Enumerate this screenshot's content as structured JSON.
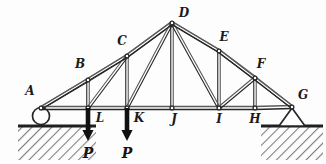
{
  "figure": {
    "style": {
      "ink": "#262626",
      "ink_light": "#5a5a5a",
      "ground_fill": "#8f8f8f",
      "background": "#fdfdfd",
      "member_width": 1.1,
      "chord_width": 1.6
    }
  },
  "geometry": {
    "view_box": "0 0 326 164",
    "nodes": [
      {
        "id": "A",
        "x": 41,
        "y": 108,
        "label": "A",
        "label_x": 30,
        "label_y": 95,
        "label_anchor": "middle"
      },
      {
        "id": "B",
        "x": 88,
        "y": 80,
        "label": "B",
        "label_x": 80,
        "label_y": 68,
        "label_anchor": "middle"
      },
      {
        "id": "C",
        "x": 127,
        "y": 56,
        "label": "C",
        "label_x": 122,
        "label_y": 45,
        "label_anchor": "middle"
      },
      {
        "id": "D",
        "x": 172,
        "y": 23,
        "label": "D",
        "label_x": 184,
        "label_y": 17,
        "label_anchor": "middle"
      },
      {
        "id": "E",
        "x": 219,
        "y": 51,
        "label": "E",
        "label_x": 224,
        "label_y": 41,
        "label_anchor": "middle"
      },
      {
        "id": "F",
        "x": 255,
        "y": 78,
        "label": "F",
        "label_x": 261,
        "label_y": 68,
        "label_anchor": "middle"
      },
      {
        "id": "G",
        "x": 292,
        "y": 107,
        "label": "G",
        "label_x": 303,
        "label_y": 99,
        "label_anchor": "middle"
      },
      {
        "id": "H",
        "x": 255,
        "y": 108,
        "label": "H",
        "label_x": 255,
        "label_y": 123,
        "label_anchor": "middle"
      },
      {
        "id": "I",
        "x": 219,
        "y": 108,
        "label": "I",
        "label_x": 219,
        "label_y": 123,
        "label_anchor": "middle"
      },
      {
        "id": "J",
        "x": 172,
        "y": 108,
        "label": "J",
        "label_x": 174,
        "label_y": 123,
        "label_anchor": "middle"
      },
      {
        "id": "K",
        "x": 127,
        "y": 108,
        "label": "K",
        "label_x": 139,
        "label_y": 122,
        "label_anchor": "middle"
      },
      {
        "id": "L",
        "x": 88,
        "y": 108,
        "label": "L",
        "label_x": 100,
        "label_y": 122,
        "label_anchor": "middle"
      }
    ],
    "members": [
      {
        "from": "A",
        "to": "B",
        "kind": "top-chord"
      },
      {
        "from": "B",
        "to": "C",
        "kind": "top-chord"
      },
      {
        "from": "C",
        "to": "D",
        "kind": "top-chord"
      },
      {
        "from": "D",
        "to": "E",
        "kind": "top-chord"
      },
      {
        "from": "E",
        "to": "F",
        "kind": "top-chord"
      },
      {
        "from": "F",
        "to": "G",
        "kind": "top-chord"
      },
      {
        "from": "A",
        "to": "L",
        "kind": "bottom-chord"
      },
      {
        "from": "L",
        "to": "K",
        "kind": "bottom-chord"
      },
      {
        "from": "K",
        "to": "J",
        "kind": "bottom-chord"
      },
      {
        "from": "J",
        "to": "I",
        "kind": "bottom-chord"
      },
      {
        "from": "I",
        "to": "H",
        "kind": "bottom-chord"
      },
      {
        "from": "H",
        "to": "G",
        "kind": "bottom-chord"
      },
      {
        "from": "B",
        "to": "L",
        "kind": "vertical"
      },
      {
        "from": "C",
        "to": "K",
        "kind": "vertical"
      },
      {
        "from": "D",
        "to": "J",
        "kind": "vertical"
      },
      {
        "from": "E",
        "to": "I",
        "kind": "vertical"
      },
      {
        "from": "F",
        "to": "H",
        "kind": "vertical"
      },
      {
        "from": "L",
        "to": "C",
        "kind": "diagonal"
      },
      {
        "from": "K",
        "to": "D",
        "kind": "diagonal"
      },
      {
        "from": "D",
        "to": "I",
        "kind": "diagonal"
      },
      {
        "from": "I",
        "to": "F",
        "kind": "diagonal"
      },
      {
        "from": "A",
        "to": "C",
        "kind": "diagonal"
      },
      {
        "from": "C",
        "to": "D",
        "kind": "diagonal"
      },
      {
        "from": "D",
        "to": "E",
        "kind": "diagonal"
      },
      {
        "from": "E",
        "to": "G",
        "kind": "diagonal"
      }
    ]
  },
  "supports": {
    "roller": {
      "node": "A",
      "type": "roller-circle",
      "cx": 41,
      "cy": 116,
      "r": 8.5
    },
    "pin": {
      "node": "G",
      "type": "pin-triangle",
      "apex_x": 292,
      "apex_y": 108,
      "base_left_x": 279,
      "base_right_x": 305,
      "base_y": 126
    }
  },
  "ground": [
    {
      "id": "left",
      "x": 18,
      "y": 126,
      "width": 78,
      "height": 34
    },
    {
      "id": "right",
      "x": 261,
      "y": 126,
      "width": 62,
      "height": 34
    }
  ],
  "loads": [
    {
      "node": "L",
      "x": 88,
      "y_start": 108,
      "y_end": 141,
      "label": "P",
      "label_x": 88,
      "label_y": 158
    },
    {
      "node": "K",
      "x": 127,
      "y_start": 108,
      "y_end": 141,
      "label": "P",
      "label_x": 127,
      "label_y": 158
    }
  ],
  "labels": {
    "load_symbol": "P",
    "node_ids": [
      "A",
      "B",
      "C",
      "D",
      "E",
      "F",
      "G",
      "H",
      "I",
      "J",
      "K",
      "L"
    ]
  }
}
